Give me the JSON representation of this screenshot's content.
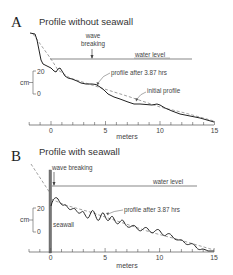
{
  "panels": [
    {
      "letter": "A",
      "title": "Profile without seawall",
      "labels": {
        "wave_breaking_1": "wave",
        "wave_breaking_2": "breaking",
        "water_level": "water level",
        "profile_after": "profile after 3.87 hrs",
        "initial_profile": "initial profile"
      },
      "y_axis": {
        "unit": "cm",
        "ticks": [
          "20",
          "0"
        ]
      },
      "x_axis": {
        "name": "meters",
        "ticks": [
          "0",
          "5",
          "10",
          "15"
        ]
      }
    },
    {
      "letter": "B",
      "title": "Profile with seawall",
      "labels": {
        "wave_breaking": "wave breaking",
        "water_level": "water level",
        "profile_after": "profile after 3.87 hrs",
        "seawall": "seawall"
      },
      "y_axis": {
        "unit": "cm",
        "ticks": [
          "20",
          "0"
        ]
      },
      "x_axis": {
        "name": "meters",
        "ticks": [
          "0",
          "5",
          "10",
          "15"
        ]
      }
    }
  ],
  "colors": {
    "profile_line": "#222222",
    "initial_profile_dashed": "#888888",
    "water_level": "#555555",
    "seawall": "#666666"
  }
}
